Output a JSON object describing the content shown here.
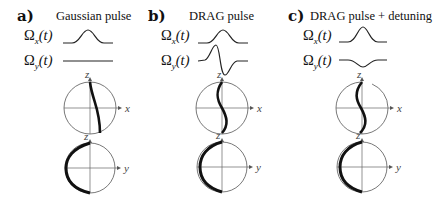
{
  "panels": [
    {
      "letter": "a)",
      "title": "Gaussian pulse",
      "omega_x": {
        "symbol": "Ω",
        "sub": "x",
        "arg": "(t)"
      },
      "omega_y": {
        "symbol": "Ω",
        "sub": "y",
        "arg": "(t)"
      },
      "pulse_x_shape": "gaussian",
      "pulse_y_shape": "flat",
      "bloch_xz": {
        "horizontal_axis": "x",
        "vertical_axis": "z"
      },
      "bloch_yz": {
        "horizontal_axis": "y",
        "vertical_axis": "z"
      }
    },
    {
      "letter": "b)",
      "title": "DRAG pulse",
      "omega_x": {
        "symbol": "Ω",
        "sub": "x",
        "arg": "(t)"
      },
      "omega_y": {
        "symbol": "Ω",
        "sub": "y",
        "arg": "(t)"
      },
      "pulse_x_shape": "gaussian",
      "pulse_y_shape": "derivative-of-gaussian",
      "bloch_xz": {
        "horizontal_axis": "x",
        "vertical_axis": "z"
      },
      "bloch_yz": {
        "horizontal_axis": "y",
        "vertical_axis": "z"
      }
    },
    {
      "letter": "c)",
      "title": "DRAG pulse + detuning",
      "omega_x": {
        "symbol": "Ω",
        "sub": "x",
        "arg": "(t)"
      },
      "omega_y": {
        "symbol": "Ω",
        "sub": "y",
        "arg": "(t)"
      },
      "pulse_x_shape": "gaussian",
      "pulse_y_shape": "negative-gaussian-small",
      "bloch_xz": {
        "horizontal_axis": "x",
        "vertical_axis": "z"
      },
      "bloch_yz": {
        "horizontal_axis": "y",
        "vertical_axis": "z"
      }
    }
  ],
  "colors": {
    "trajectory": "#111111",
    "circle": "#555555",
    "axis": "#666666"
  }
}
